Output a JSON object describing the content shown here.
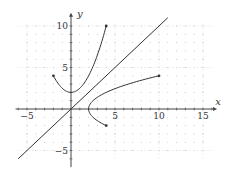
{
  "chart_data": {
    "type": "line",
    "title": "",
    "xlabel": "x",
    "ylabel": "y",
    "xlim": [
      -6,
      16
    ],
    "ylim": [
      -6,
      11
    ],
    "grid": "dotted",
    "x_ticks": [
      "-5",
      "5",
      "10",
      "15"
    ],
    "y_ticks": [
      "10",
      "5",
      "-5"
    ],
    "series": [
      {
        "name": "y = x^2/2 + 2",
        "type": "curve",
        "x_range": [
          -2,
          4
        ],
        "endpoints": [
          [
            -2,
            4
          ],
          [
            4,
            10
          ]
        ]
      },
      {
        "name": "x = y^2/2 + 2 (inverse)",
        "type": "curve",
        "y_range": [
          -2,
          4
        ],
        "endpoints": [
          [
            4,
            -2
          ],
          [
            10,
            4
          ]
        ]
      },
      {
        "name": "y = x",
        "type": "line",
        "x_range": [
          -6,
          11
        ]
      }
    ]
  },
  "colors": {
    "axis": "#444444",
    "curve": "#333333",
    "grid": "#bbbbbb"
  }
}
